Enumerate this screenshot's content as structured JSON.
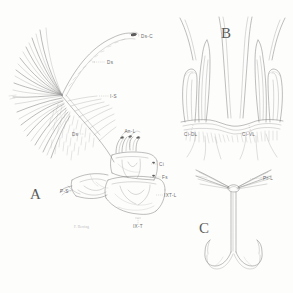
{
  "plate": {
    "title": "Anatomical plate — three figures",
    "background_color": "#fdfdfc",
    "ink_color": "#6e6e6e",
    "label_color": "#6b6b6b",
    "width": 293,
    "height": 293
  },
  "panels": [
    {
      "id": "A",
      "letter": "A",
      "letter_x": 30,
      "letter_y": 199,
      "description": "lateral view of terminal abdominal segments with setal fan"
    },
    {
      "id": "B",
      "letter": "B",
      "letter_x": 221,
      "letter_y": 38,
      "description": "dorsal view of paired cercal lobes"
    },
    {
      "id": "C",
      "letter": "C",
      "letter_x": 199,
      "letter_y": 233,
      "description": "ventral view of forked process with lateral rays"
    }
  ],
  "labels": [
    {
      "id": "ds-c",
      "text": "Ds-C",
      "panel": "A",
      "x": 141,
      "y": 38,
      "anchor": "start"
    },
    {
      "id": "ds",
      "text": "Ds",
      "panel": "A",
      "x": 107,
      "y": 64,
      "anchor": "start"
    },
    {
      "id": "i-s",
      "text": "I-S",
      "panel": "A",
      "x": 110,
      "y": 98,
      "anchor": "start"
    },
    {
      "id": "an-l",
      "text": "An-L",
      "panel": "A",
      "x": 130,
      "y": 133,
      "anchor": "middle"
    },
    {
      "id": "ds2",
      "text": "Ds",
      "panel": "A",
      "x": 72,
      "y": 136,
      "anchor": "start"
    },
    {
      "id": "ci",
      "text": "Ci",
      "panel": "A",
      "x": 159,
      "y": 166,
      "anchor": "start"
    },
    {
      "id": "fs",
      "text": "Fs",
      "panel": "A",
      "x": 162,
      "y": 179,
      "anchor": "start"
    },
    {
      "id": "p-s",
      "text": "P-S",
      "panel": "A",
      "x": 60,
      "y": 193,
      "anchor": "start"
    },
    {
      "id": "ixt-l",
      "text": "IXT-L",
      "panel": "A",
      "x": 164,
      "y": 197,
      "anchor": "start"
    },
    {
      "id": "ix-t",
      "text": "IX-T",
      "panel": "A",
      "x": 138,
      "y": 228,
      "anchor": "middle"
    },
    {
      "id": "ci-dl",
      "text": "Ci-DL",
      "panel": "B",
      "x": 184,
      "y": 136,
      "anchor": "start"
    },
    {
      "id": "ci-vl",
      "text": "Ci-VL",
      "panel": "B",
      "x": 242,
      "y": 136,
      "anchor": "start"
    },
    {
      "id": "pr-l",
      "text": "Pr-L",
      "panel": "C",
      "x": 263,
      "y": 180,
      "anchor": "start"
    }
  ],
  "signature": {
    "text": "F. Herring",
    "x": 74,
    "y": 228
  }
}
